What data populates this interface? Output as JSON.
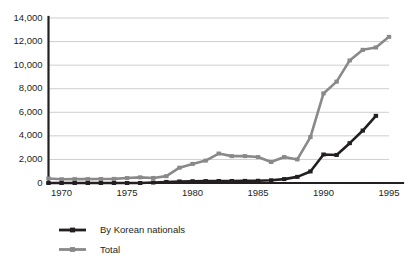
{
  "chart_data": {
    "type": "line",
    "title": "",
    "xlabel": "",
    "ylabel": "",
    "xlim": [
      1969,
      1995
    ],
    "ylim": [
      0,
      14000
    ],
    "grid": true,
    "legend_position": "bottom-left",
    "y_ticks": [
      0,
      2000,
      4000,
      6000,
      8000,
      10000,
      12000,
      14000
    ],
    "y_tick_labels": [
      "0",
      "2,000",
      "4,000",
      "6,000",
      "8,000",
      "10,000",
      "12,000",
      "14,000"
    ],
    "x_ticks": [
      1970,
      1975,
      1980,
      1985,
      1990,
      1995
    ],
    "x_tick_labels": [
      "1970",
      "1975",
      "1980",
      "1985",
      "1990",
      "1995"
    ],
    "x": [
      1969,
      1970,
      1971,
      1972,
      1973,
      1974,
      1975,
      1976,
      1977,
      1978,
      1979,
      1980,
      1981,
      1982,
      1983,
      1984,
      1985,
      1986,
      1987,
      1988,
      1989,
      1990,
      1991,
      1992,
      1993,
      1994,
      1995
    ],
    "series": [
      {
        "name": "By Korean nationals",
        "color": "#231f20",
        "marker": "square",
        "values": [
          0,
          0,
          0,
          0,
          0,
          0,
          0,
          0,
          40,
          90,
          130,
          150,
          160,
          170,
          170,
          180,
          190,
          230,
          330,
          520,
          980,
          2420,
          2380,
          3380,
          4450,
          5700,
          null
        ]
      },
      {
        "name": "Total",
        "color": "#898989",
        "marker": "square",
        "values": [
          380,
          320,
          330,
          330,
          340,
          350,
          420,
          480,
          430,
          580,
          1300,
          1620,
          1900,
          2500,
          2280,
          2280,
          2200,
          1780,
          2200,
          2000,
          3900,
          7600,
          8600,
          10400,
          11300,
          11500,
          12400
        ]
      }
    ]
  },
  "legend": {
    "items": [
      {
        "label": "By Korean nationals",
        "color": "#231f20"
      },
      {
        "label": "Total",
        "color": "#898989"
      }
    ]
  }
}
